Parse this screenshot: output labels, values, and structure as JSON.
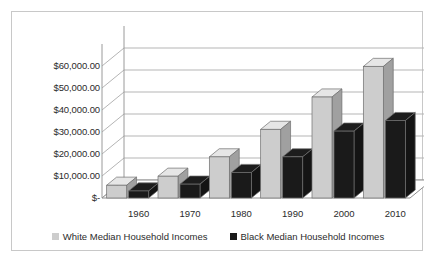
{
  "chart_data": {
    "type": "bar",
    "title": "",
    "subtitle": "",
    "xlabel": "",
    "ylabel": "",
    "categories": [
      "1960",
      "1970",
      "1980",
      "1990",
      "2000",
      "2010"
    ],
    "series": [
      {
        "name": "White Median Household Incomes",
        "color": "#cdcdcd",
        "values": [
          5800,
          9900,
          18700,
          31200,
          45900,
          59800
        ]
      },
      {
        "name": "Black Median Household Incomes",
        "color": "#1a1a1a",
        "values": [
          3200,
          6300,
          11600,
          18700,
          30400,
          35200
        ]
      }
    ],
    "ylim": [
      0,
      70000
    ],
    "ytick_values": [
      0,
      10000,
      20000,
      30000,
      40000,
      50000,
      60000
    ],
    "ytick_labels": [
      "$-",
      "$10,000.00",
      "$20,000.00",
      "$30,000.00",
      "$40,000.00",
      "$50,000.00",
      "$60,000.00"
    ],
    "grid": true,
    "legend_position": "bottom",
    "style": "3d-clustered-column",
    "plot_background": "#ffffff",
    "gridline_color": "#b5b5b5",
    "border_color": "#c8c8c8",
    "text_color": "#2b2b2b"
  },
  "legend": {
    "items": [
      {
        "label": "White Median Household Incomes",
        "swatch": "#cdcdcd"
      },
      {
        "label": "Black Median Household Incomes",
        "swatch": "#1a1a1a"
      }
    ]
  }
}
